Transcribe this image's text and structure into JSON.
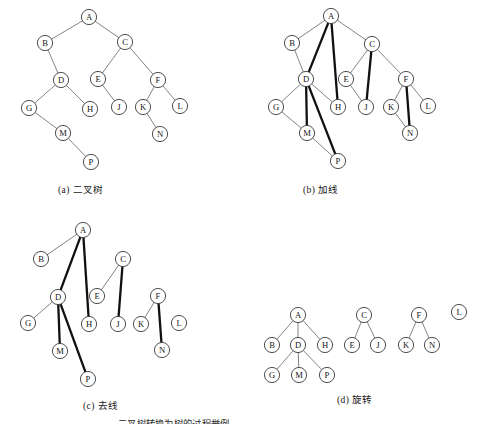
{
  "figure": {
    "title_partial": "二叉树转换为树的过程举例",
    "panels": [
      {
        "key": "a",
        "caption": "(a) 二叉树"
      },
      {
        "key": "b",
        "caption": "(b) 加线"
      },
      {
        "key": "c",
        "caption": "(c) 去线"
      },
      {
        "key": "d",
        "caption": "(d) 旋转"
      }
    ],
    "colors": {
      "node_stroke": "#3b3b3b",
      "node_fill": "#ffffff",
      "edge_thin": "#6e6e6e",
      "edge_thick": "#111111",
      "text": "#161616"
    },
    "node_radius": 7.6
  },
  "panel_a": {
    "caption": "(a) 二叉树",
    "nodes": [
      {
        "id": "A",
        "label": "A",
        "x": 89,
        "y": 17
      },
      {
        "id": "B",
        "label": "B",
        "x": 45,
        "y": 43
      },
      {
        "id": "C",
        "label": "C",
        "x": 125,
        "y": 42
      },
      {
        "id": "D",
        "label": "D",
        "x": 61,
        "y": 80
      },
      {
        "id": "E",
        "label": "E",
        "x": 98,
        "y": 79
      },
      {
        "id": "F",
        "label": "F",
        "x": 158,
        "y": 80
      },
      {
        "id": "G",
        "label": "G",
        "x": 29,
        "y": 108
      },
      {
        "id": "H",
        "label": "H",
        "x": 90,
        "y": 109
      },
      {
        "id": "J",
        "label": "J",
        "x": 119,
        "y": 107
      },
      {
        "id": "K",
        "label": "K",
        "x": 143,
        "y": 107
      },
      {
        "id": "L",
        "label": "L",
        "x": 180,
        "y": 106
      },
      {
        "id": "M",
        "label": "M",
        "x": 63,
        "y": 133
      },
      {
        "id": "N",
        "label": "N",
        "x": 160,
        "y": 134
      },
      {
        "id": "P",
        "label": "P",
        "x": 91,
        "y": 162
      }
    ],
    "edges": [
      {
        "from": "A",
        "to": "B",
        "weight": "thin"
      },
      {
        "from": "A",
        "to": "C",
        "weight": "thin"
      },
      {
        "from": "B",
        "to": "D",
        "weight": "thin"
      },
      {
        "from": "C",
        "to": "E",
        "weight": "thin"
      },
      {
        "from": "C",
        "to": "F",
        "weight": "thin"
      },
      {
        "from": "D",
        "to": "G",
        "weight": "thin"
      },
      {
        "from": "D",
        "to": "H",
        "weight": "thin"
      },
      {
        "from": "E",
        "to": "J",
        "weight": "thin"
      },
      {
        "from": "F",
        "to": "K",
        "weight": "thin"
      },
      {
        "from": "F",
        "to": "L",
        "weight": "thin"
      },
      {
        "from": "G",
        "to": "M",
        "weight": "thin"
      },
      {
        "from": "K",
        "to": "N",
        "weight": "thin"
      },
      {
        "from": "M",
        "to": "P",
        "weight": "thin"
      }
    ]
  },
  "panel_b": {
    "caption": "(b) 加线",
    "nodes": [
      {
        "id": "A",
        "label": "A",
        "x": 331,
        "y": 16
      },
      {
        "id": "B",
        "label": "B",
        "x": 292,
        "y": 43
      },
      {
        "id": "C",
        "label": "C",
        "x": 372,
        "y": 44
      },
      {
        "id": "D",
        "label": "D",
        "x": 306,
        "y": 79
      },
      {
        "id": "E",
        "label": "E",
        "x": 346,
        "y": 79
      },
      {
        "id": "F",
        "label": "F",
        "x": 406,
        "y": 79
      },
      {
        "id": "G",
        "label": "G",
        "x": 276,
        "y": 107
      },
      {
        "id": "H",
        "label": "H",
        "x": 338,
        "y": 107
      },
      {
        "id": "J",
        "label": "J",
        "x": 366,
        "y": 107
      },
      {
        "id": "K",
        "label": "K",
        "x": 391,
        "y": 107
      },
      {
        "id": "L",
        "label": "L",
        "x": 428,
        "y": 106
      },
      {
        "id": "M",
        "label": "M",
        "x": 307,
        "y": 133
      },
      {
        "id": "N",
        "label": "N",
        "x": 410,
        "y": 133
      },
      {
        "id": "P",
        "label": "P",
        "x": 338,
        "y": 161
      }
    ],
    "edges": [
      {
        "from": "A",
        "to": "B",
        "weight": "thin"
      },
      {
        "from": "A",
        "to": "C",
        "weight": "thin"
      },
      {
        "from": "B",
        "to": "D",
        "weight": "thin"
      },
      {
        "from": "A",
        "to": "D",
        "weight": "thick"
      },
      {
        "from": "A",
        "to": "H",
        "weight": "thick"
      },
      {
        "from": "C",
        "to": "E",
        "weight": "thin"
      },
      {
        "from": "C",
        "to": "F",
        "weight": "thin"
      },
      {
        "from": "C",
        "to": "J",
        "weight": "thick"
      },
      {
        "from": "E",
        "to": "J",
        "weight": "thin"
      },
      {
        "from": "D",
        "to": "G",
        "weight": "thin"
      },
      {
        "from": "D",
        "to": "H",
        "weight": "thin"
      },
      {
        "from": "D",
        "to": "M",
        "weight": "thick"
      },
      {
        "from": "D",
        "to": "P",
        "weight": "thick"
      },
      {
        "from": "G",
        "to": "M",
        "weight": "thin"
      },
      {
        "from": "M",
        "to": "P",
        "weight": "thin"
      },
      {
        "from": "F",
        "to": "K",
        "weight": "thin"
      },
      {
        "from": "F",
        "to": "L",
        "weight": "thin"
      },
      {
        "from": "F",
        "to": "N",
        "weight": "thick"
      },
      {
        "from": "K",
        "to": "N",
        "weight": "thin"
      }
    ]
  },
  "panel_c": {
    "caption": "(c) 去线",
    "nodes": [
      {
        "id": "A",
        "label": "A",
        "x": 83,
        "y": 230
      },
      {
        "id": "B",
        "label": "B",
        "x": 41,
        "y": 259
      },
      {
        "id": "C",
        "label": "C",
        "x": 123,
        "y": 259
      },
      {
        "id": "D",
        "label": "D",
        "x": 58,
        "y": 297
      },
      {
        "id": "E",
        "label": "E",
        "x": 97,
        "y": 296
      },
      {
        "id": "F",
        "label": "F",
        "x": 158,
        "y": 296
      },
      {
        "id": "G",
        "label": "G",
        "x": 28,
        "y": 323
      },
      {
        "id": "H",
        "label": "H",
        "x": 89,
        "y": 324
      },
      {
        "id": "J",
        "label": "J",
        "x": 118,
        "y": 324
      },
      {
        "id": "K",
        "label": "K",
        "x": 141,
        "y": 324
      },
      {
        "id": "L",
        "label": "L",
        "x": 179,
        "y": 323
      },
      {
        "id": "M",
        "label": "M",
        "x": 60,
        "y": 351
      },
      {
        "id": "N",
        "label": "N",
        "x": 162,
        "y": 350
      },
      {
        "id": "P",
        "label": "P",
        "x": 88,
        "y": 379
      }
    ],
    "edges": [
      {
        "from": "A",
        "to": "B",
        "weight": "thin"
      },
      {
        "from": "A",
        "to": "D",
        "weight": "thick"
      },
      {
        "from": "A",
        "to": "H",
        "weight": "thick"
      },
      {
        "from": "C",
        "to": "E",
        "weight": "thin"
      },
      {
        "from": "C",
        "to": "J",
        "weight": "thick"
      },
      {
        "from": "D",
        "to": "G",
        "weight": "thin"
      },
      {
        "from": "D",
        "to": "M",
        "weight": "thick"
      },
      {
        "from": "D",
        "to": "P",
        "weight": "thick"
      },
      {
        "from": "F",
        "to": "K",
        "weight": "thin"
      },
      {
        "from": "F",
        "to": "N",
        "weight": "thick"
      }
    ]
  },
  "panel_d": {
    "caption": "(d) 旋转",
    "nodes": [
      {
        "id": "A",
        "label": "A",
        "x": 298,
        "y": 315
      },
      {
        "id": "B",
        "label": "B",
        "x": 272,
        "y": 345
      },
      {
        "id": "D",
        "label": "D",
        "x": 298,
        "y": 345
      },
      {
        "id": "H",
        "label": "H",
        "x": 325,
        "y": 345
      },
      {
        "id": "G",
        "label": "G",
        "x": 272,
        "y": 375
      },
      {
        "id": "M",
        "label": "M",
        "x": 299,
        "y": 375
      },
      {
        "id": "P",
        "label": "P",
        "x": 327,
        "y": 375
      },
      {
        "id": "C",
        "label": "C",
        "x": 364,
        "y": 315
      },
      {
        "id": "E",
        "label": "E",
        "x": 352,
        "y": 345
      },
      {
        "id": "J",
        "label": "J",
        "x": 378,
        "y": 345
      },
      {
        "id": "F",
        "label": "F",
        "x": 419,
        "y": 315
      },
      {
        "id": "K",
        "label": "K",
        "x": 406,
        "y": 345
      },
      {
        "id": "N",
        "label": "N",
        "x": 432,
        "y": 345
      },
      {
        "id": "L",
        "label": "L",
        "x": 459,
        "y": 312
      }
    ],
    "edges": [
      {
        "from": "A",
        "to": "B",
        "weight": "thin"
      },
      {
        "from": "A",
        "to": "D",
        "weight": "thin"
      },
      {
        "from": "A",
        "to": "H",
        "weight": "thin"
      },
      {
        "from": "D",
        "to": "G",
        "weight": "thin"
      },
      {
        "from": "D",
        "to": "M",
        "weight": "thin"
      },
      {
        "from": "D",
        "to": "P",
        "weight": "thin"
      },
      {
        "from": "C",
        "to": "E",
        "weight": "thin"
      },
      {
        "from": "C",
        "to": "J",
        "weight": "thin"
      },
      {
        "from": "F",
        "to": "K",
        "weight": "thin"
      },
      {
        "from": "F",
        "to": "N",
        "weight": "thin"
      }
    ]
  }
}
